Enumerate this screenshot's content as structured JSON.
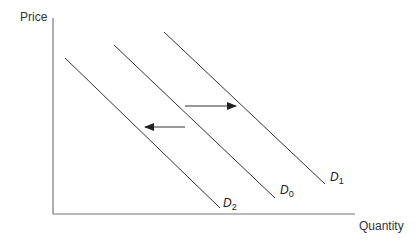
{
  "diagram": {
    "y_axis_label": "Price",
    "x_axis_label": "Quantity",
    "curves": [
      {
        "id": "D2",
        "letter": "D",
        "subscript": "2",
        "x1": 65,
        "y1": 58,
        "x2": 220,
        "y2": 208
      },
      {
        "id": "D0",
        "letter": "D",
        "subscript": "0",
        "x1": 114,
        "y1": 45,
        "x2": 275,
        "y2": 198
      },
      {
        "id": "D1",
        "letter": "D",
        "subscript": "1",
        "x1": 164,
        "y1": 32,
        "x2": 325,
        "y2": 184
      }
    ],
    "arrows": [
      {
        "direction": "right",
        "meaning": "increase in demand (D0 to D1)"
      },
      {
        "direction": "left",
        "meaning": "decrease in demand (D0 to D2)"
      }
    ],
    "colors": {
      "line": "#333333",
      "axis": "#777777",
      "background": "#ffffff"
    }
  }
}
